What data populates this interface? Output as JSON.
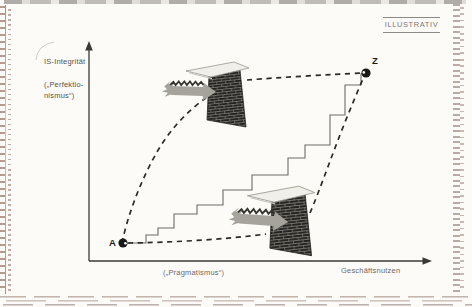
{
  "tag": {
    "label": "ILLUSTRATIV"
  },
  "axes": {
    "y_title": "IS-Integrität",
    "y_note_line1": "(„Perfektio-",
    "y_note_line2": "nismus“)",
    "x_note": "(„Pragmatismus“)",
    "x_title": "Geschäftsnutzen"
  },
  "points": {
    "start_label": "A",
    "end_label": "Z"
  },
  "colors": {
    "axis": "#3a3936",
    "dashed_path": "#2b2a27",
    "staircase": "#6e6c68",
    "wall_brick": "#242320",
    "wall_mortar": "#8f8c83",
    "wall_cap": "#f1efe9",
    "impact_arrow": "#a6a39d",
    "marker": "#191917",
    "scan_edge": "#b59a90",
    "label_gray": "#6d6a66"
  },
  "geometry": {
    "y_axis_d": "M89,261 L89,48",
    "y_arrowhead": "89,41 85.2,50.5 92.8,50.5",
    "x_axis_d": "M89,261 L424,261",
    "x_arrowhead": "432,261 422.5,257.2 422.5,264.8",
    "staircase": [
      [
        123,
        243
      ],
      [
        146,
        243
      ],
      [
        146,
        235
      ],
      [
        158,
        235
      ],
      [
        158,
        228
      ],
      [
        174,
        228
      ],
      [
        174,
        214
      ],
      [
        197,
        214
      ],
      [
        197,
        205
      ],
      [
        223,
        205
      ],
      [
        223,
        190
      ],
      [
        252,
        190
      ],
      [
        252,
        175
      ],
      [
        288,
        175
      ],
      [
        288,
        158
      ],
      [
        305,
        158
      ],
      [
        305,
        145
      ],
      [
        330,
        145
      ],
      [
        330,
        115
      ],
      [
        345,
        115
      ],
      [
        345,
        85
      ],
      [
        361,
        85
      ],
      [
        361,
        74
      ],
      [
        366,
        73
      ]
    ],
    "curve_perfectionism_up": "M122,243 C128,214 141,180 157,152 C169,131 187,111 206,98",
    "curve_perfectionism_blocked": "M247,80 C278,77.5 330,74.5 362,73",
    "curve_pragmatism_right": "M128,243 C170,242.5 226,239.5 266,234",
    "curve_pragmatism_blocked": "M310,213 C320,190 336,143 352,105 C356,95.5 360,85 364,77",
    "wall_top_t": "translate(209,74)",
    "wall_bottom_t": "translate(272,199) scale(1.07)",
    "arrow_top_t": "translate(216,92) rotate(2)",
    "arrow_bottom_t": "translate(288,222) rotate(4) scale(1.1)",
    "point_a_t": "translate(123,243)",
    "point_z_t": "translate(366,73)",
    "corner_arc_d": "M36,60 Q37,45 54,42"
  }
}
